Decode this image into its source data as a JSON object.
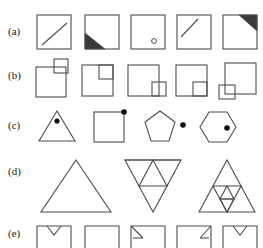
{
  "figure": {
    "background_color": "#ffffff",
    "line_color": "#4d4d4d",
    "fill_color": "#3a3a3a",
    "dot_color": "#0f0f0f",
    "width": 263,
    "height": 246
  },
  "rows": [
    {
      "id": "a",
      "label": "(a)",
      "description": "Five squares with varying corner marks",
      "cells": [
        {
          "name": "square-with-diagonal-lower-right",
          "glyph": "square with short diagonal line in lower-right half"
        },
        {
          "name": "square-with-filled-lower-left-triangle",
          "glyph": "square with dark filled triangle in bottom-left corner"
        },
        {
          "name": "square-with-small-circle",
          "glyph": "square with small hollow circle near bottom-right"
        },
        {
          "name": "square-with-diagonal-upper-left",
          "glyph": "square with short diagonal line in upper-left half"
        },
        {
          "name": "square-with-filled-upper-right-triangle",
          "glyph": "square with dark filled triangle in top-right corner"
        }
      ]
    },
    {
      "id": "b",
      "label": "(b)",
      "description": "Five large squares each paired with a small square at a corner",
      "cells": [
        {
          "name": "square-small-outside-top-right",
          "glyph": "small square straddling outside the top-right corner"
        },
        {
          "name": "square-small-inside-top-right",
          "glyph": "small square inscribed at the top-right corner"
        },
        {
          "name": "square-small-straddle-right-bottom",
          "glyph": "small square straddling the right edge at bottom"
        },
        {
          "name": "square-small-inside-bottom-right",
          "glyph": "small square inscribed at the bottom-right corner"
        },
        {
          "name": "square-small-straddle-bottom-left",
          "glyph": "small square straddling the bottom-left corner"
        }
      ]
    },
    {
      "id": "c",
      "label": "(c)",
      "description": "Polygons of increasing side count, each with a filled dot",
      "cells": [
        {
          "name": "triangle-with-inner-dot",
          "glyph": "triangle with filled dot inside near apex"
        },
        {
          "name": "square-with-corner-dot",
          "glyph": "square with filled dot on the top-right vertex"
        },
        {
          "name": "pentagon-with-outside-dot",
          "glyph": "pentagon with filled dot outside to the right"
        },
        {
          "name": "hexagon-with-inner-dot",
          "glyph": "hexagon with filled dot inside to the right"
        }
      ]
    },
    {
      "id": "d",
      "label": "(d)",
      "description": "Sierpinski triangle subdivision progression",
      "cells": [
        {
          "name": "triangle-level-0",
          "glyph": "plain triangle"
        },
        {
          "name": "triangle-level-1",
          "glyph": "triangle subdivided once into four triangles"
        },
        {
          "name": "triangle-level-2",
          "glyph": "triangle subdivided twice, nested triangles"
        }
      ]
    },
    {
      "id": "e",
      "label": "(e)",
      "description": "Five squares with notches or marks along the top edge",
      "cells": [
        {
          "name": "square-with-top-v-notch",
          "glyph": "square with small V notch hanging from top edge"
        },
        {
          "name": "square-plain",
          "glyph": "plain square"
        },
        {
          "name": "square-with-left-corner-arrow",
          "glyph": "square with small arrow at top-left inside corner"
        },
        {
          "name": "square-with-right-corner-arrow",
          "glyph": "square with small arrow at top-right inside corner"
        },
        {
          "name": "square-with-top-v-notch-2",
          "glyph": "square with small V notch hanging from top edge"
        }
      ]
    }
  ]
}
